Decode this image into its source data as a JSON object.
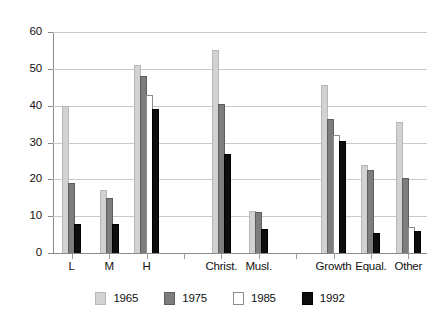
{
  "chart_data": {
    "type": "bar",
    "title": "",
    "subtitle": "",
    "xlabel": "",
    "ylabel": "",
    "ylim": [
      0,
      60
    ],
    "ytick_step": 10,
    "yticks": [
      "0",
      "10",
      "20",
      "30",
      "40",
      "50",
      "60"
    ],
    "grid": true,
    "legend_position": "bottom",
    "categories": [
      "L",
      "M",
      "H",
      "Christ.",
      "Musl.",
      "Growth",
      "Equal.",
      "Other"
    ],
    "cluster_breaks": [
      3,
      5
    ],
    "series": [
      {
        "name": "1965",
        "color": "#d2d2d2",
        "values": [
          40,
          17,
          51,
          55,
          11.5,
          45.5,
          24,
          35.5
        ]
      },
      {
        "name": "1975",
        "color": "#7d7d7d",
        "values": [
          19,
          15,
          48,
          40.5,
          11,
          36.5,
          22.5,
          20.5
        ]
      },
      {
        "name": "1985",
        "color": "#ffffff",
        "values": [
          null,
          null,
          43,
          null,
          null,
          32,
          null,
          7
        ]
      },
      {
        "name": "1992",
        "color": "#0d0d0d",
        "values": [
          8,
          8,
          39,
          27,
          6.5,
          30.5,
          5.5,
          6
        ]
      }
    ]
  },
  "legend": {
    "items": [
      {
        "label": "1965",
        "swatch": "legend-swatch-1965"
      },
      {
        "label": "1975",
        "swatch": "legend-swatch-1975"
      },
      {
        "label": "1985",
        "swatch": "legend-swatch-1985"
      },
      {
        "label": "1992",
        "swatch": "legend-swatch-1992"
      }
    ]
  }
}
